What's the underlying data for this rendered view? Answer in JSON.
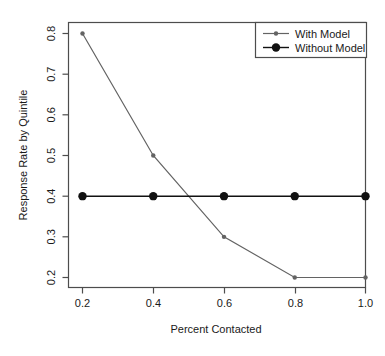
{
  "chart_data": {
    "type": "line",
    "title": "",
    "xlabel": "Percent Contacted",
    "ylabel": "Response Rate by Quintile",
    "x": [
      0.2,
      0.4,
      0.6,
      0.8,
      1.0
    ],
    "xticks": [
      "0.2",
      "0.4",
      "0.6",
      "0.8",
      "1.0"
    ],
    "yticks": [
      "0.2",
      "0.3",
      "0.4",
      "0.5",
      "0.6",
      "0.7",
      "0.8"
    ],
    "xlim": [
      0.2,
      1.0
    ],
    "ylim": [
      0.19,
      0.81
    ],
    "grid": false,
    "legend_position": "top-right",
    "series": [
      {
        "name": "With Model",
        "values": [
          0.8,
          0.5,
          0.3,
          0.2,
          0.2
        ],
        "color": "#636363",
        "marker": "small-dot",
        "marker_size": 2.2
      },
      {
        "name": "Without Model",
        "values": [
          0.4,
          0.4,
          0.4,
          0.4,
          0.4
        ],
        "color": "#111111",
        "marker": "filled-circle",
        "marker_size": 4.2
      }
    ]
  },
  "legend": {
    "entries": [
      {
        "label": "With Model"
      },
      {
        "label": "Without Model"
      }
    ]
  },
  "axes": {
    "x_title": "Percent Contacted",
    "y_title": "Response Rate by Quintile",
    "x_tick_labels": [
      "0.2",
      "0.4",
      "0.6",
      "0.8",
      "1.0"
    ],
    "y_tick_labels": [
      "0.2",
      "0.3",
      "0.4",
      "0.5",
      "0.6",
      "0.7",
      "0.8"
    ]
  },
  "colors": {
    "frame": "#4d4d4d",
    "with_model": "#636363",
    "without_model": "#111111",
    "text": "#1a1a1a",
    "background": "#ffffff"
  }
}
